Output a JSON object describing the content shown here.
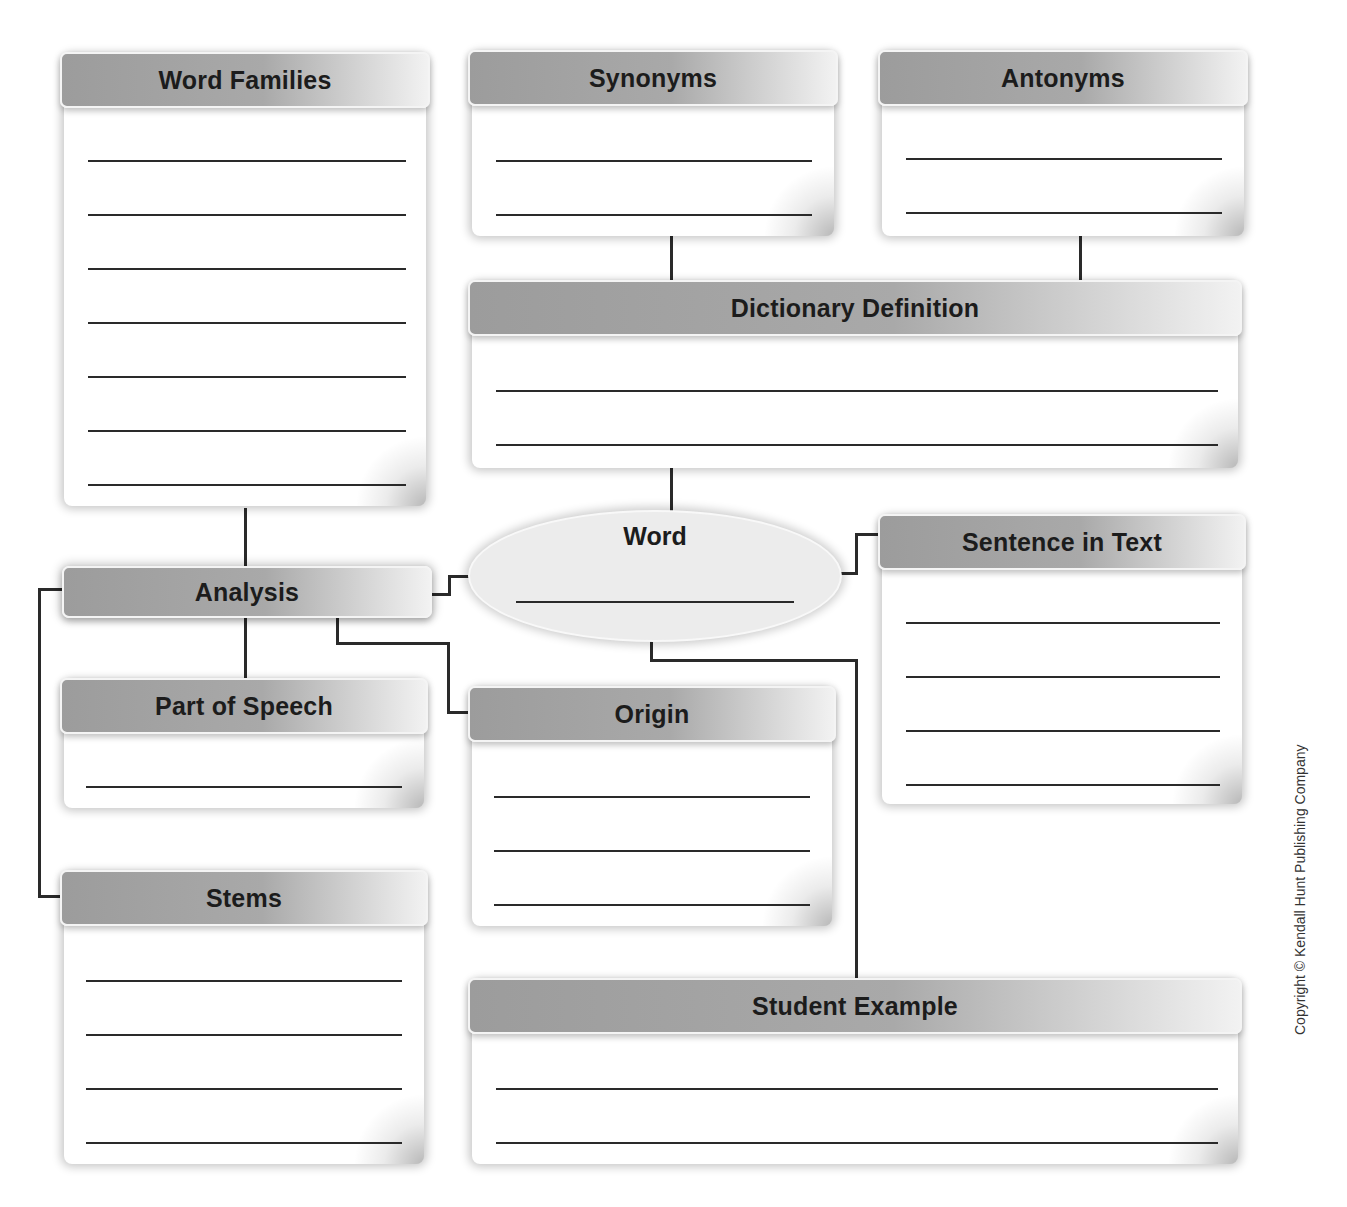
{
  "organizer": {
    "word_families": {
      "title": "Word Families",
      "lines": 7
    },
    "synonyms": {
      "title": "Synonyms",
      "lines": 2
    },
    "antonyms": {
      "title": "Antonyms",
      "lines": 2
    },
    "dictionary_definition": {
      "title": "Dictionary Definition",
      "lines": 2
    },
    "word": {
      "title": "Word",
      "lines": 1
    },
    "sentence_in_text": {
      "title": "Sentence in Text",
      "lines": 4
    },
    "analysis": {
      "title": "Analysis"
    },
    "part_of_speech": {
      "title": "Part of Speech",
      "lines": 1
    },
    "origin": {
      "title": "Origin",
      "lines": 3
    },
    "stems": {
      "title": "Stems",
      "lines": 4
    },
    "student_example": {
      "title": "Student Example",
      "lines": 2
    }
  },
  "footer": {
    "copyright": "Copyright © Kendall Hunt Publishing Company"
  },
  "colors": {
    "header_dark": "#9c9c9c",
    "header_light": "#f2f2f2",
    "line": "#2a2a2a"
  }
}
